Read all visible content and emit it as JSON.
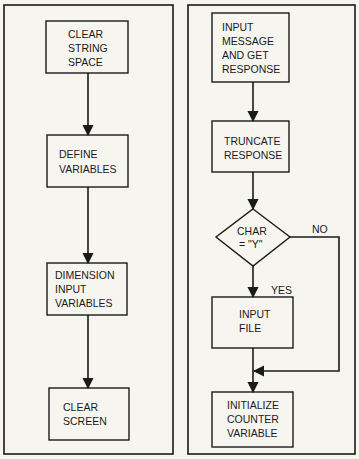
{
  "left_flowchart": {
    "steps": [
      {
        "lines": [
          "CLEAR",
          "STRING",
          "SPACE"
        ]
      },
      {
        "lines": [
          "DEFINE",
          "VARIABLES"
        ]
      },
      {
        "lines": [
          "DIMENSION",
          "INPUT",
          "VARIABLES"
        ]
      },
      {
        "lines": [
          "CLEAR",
          "SCREEN"
        ]
      }
    ]
  },
  "right_flowchart": {
    "steps": [
      {
        "lines": [
          "INPUT",
          "MESSAGE",
          "AND GET",
          "RESPONSE"
        ]
      },
      {
        "lines": [
          "TRUNCATE",
          "RESPONSE"
        ]
      }
    ],
    "decision": {
      "lines": [
        "CHAR",
        "= \"Y\""
      ],
      "yes_label": "YES",
      "no_label": "NO"
    },
    "yes_step": {
      "lines": [
        "INPUT",
        "FILE"
      ]
    },
    "final_step": {
      "lines": [
        "INITIALIZE",
        "COUNTER",
        "VARIABLE"
      ]
    }
  },
  "colors": {
    "ink": "#1a1a1a",
    "paper": "#f7f5f0"
  }
}
